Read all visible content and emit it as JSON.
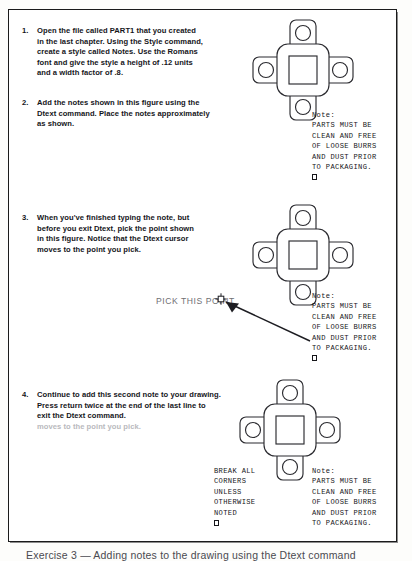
{
  "document": {
    "title": "AutoCAD Dtext exercise page",
    "page_background": "#ffffff",
    "border_color": "#1b1b1b"
  },
  "steps": [
    {
      "number": "1.",
      "lines": [
        "Open the file called PART1 that you created",
        "in the last chapter. Using the Style command,",
        "create a style called Notes. Use the Romans",
        "font and give the style a height of .12 units",
        "and a width factor of .8."
      ]
    },
    {
      "number": "2.",
      "lines": [
        "Add the notes shown in this figure using the",
        "Dtext command. Place the notes approximately",
        "as shown."
      ]
    },
    {
      "number": "3.",
      "lines": [
        "When you've finished typing the note, but",
        "before you exit Dtext, pick the point shown",
        "in this figure.  Notice that the Dtext cursor",
        "moves to the point you pick."
      ]
    },
    {
      "number": "4.",
      "lines": [
        "Continue to add this second note to your drawing.",
        "Press return twice at the end of the last line to",
        "exit the Dtext command."
      ],
      "ghost_line": "moves to the point you pick."
    }
  ],
  "notes": {
    "parts_note": {
      "lines": [
        "Note:",
        "PARTS MUST BE",
        "CLEAN AND FREE",
        "OF LOOSE BURRS",
        "AND DUST PRIOR",
        "TO PACKAGING."
      ],
      "has_cursor_box": true
    },
    "break_note": {
      "lines": [
        "BREAK ALL",
        "CORNERS",
        "UNLESS",
        "OTHERWISE",
        "NOTED"
      ],
      "has_cursor_box": true
    }
  },
  "callout": {
    "label": "PICK THIS POINT",
    "label_color": "#6f6f73",
    "marker": "pick-point-crosshair"
  },
  "bottom_caption": {
    "text": "Exercise 3 — Adding notes to the drawing using the Dtext command"
  },
  "figure": {
    "name": "cross-shaped-plate",
    "line_color": "#2b2b30",
    "features": [
      "rounded-square-body",
      "square-center-hole",
      "four-arms",
      "four-round-holes"
    ]
  }
}
